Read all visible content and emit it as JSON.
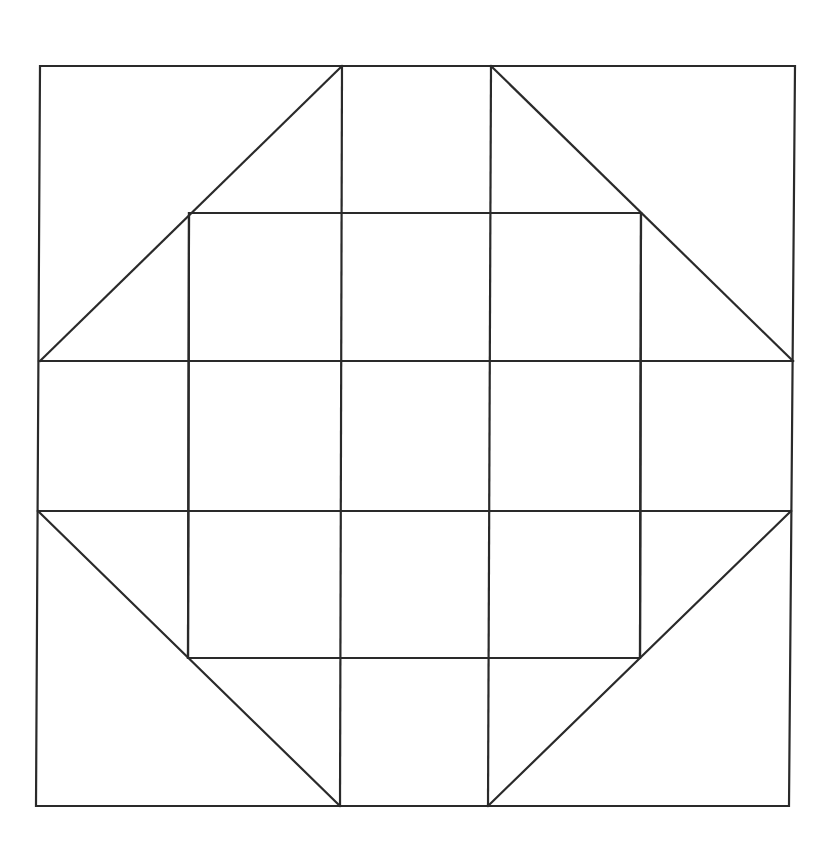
{
  "diagram": {
    "type": "quilt-block-line-drawing",
    "canvas": {
      "width": 826,
      "height": 847,
      "background": "#ffffff"
    },
    "stroke_color": "#2a2a2a",
    "outer_square": {
      "points": [
        [
          40,
          66
        ],
        [
          795,
          66
        ],
        [
          789,
          806
        ],
        [
          36,
          806
        ]
      ]
    },
    "inner_square": {
      "points": [
        [
          189,
          213
        ],
        [
          641,
          213
        ],
        [
          640,
          658
        ],
        [
          188,
          658
        ]
      ]
    },
    "vertical_lines": [
      {
        "from": [
          342,
          66
        ],
        "to": [
          340,
          806
        ]
      },
      {
        "from": [
          491,
          66
        ],
        "to": [
          488,
          806
        ]
      },
      {
        "from": [
          189,
          213
        ],
        "to": [
          188,
          658
        ]
      },
      {
        "from": [
          641,
          213
        ],
        "to": [
          640,
          658
        ]
      }
    ],
    "horizontal_lines": [
      {
        "from": [
          39,
          361
        ],
        "to": [
          793,
          361
        ]
      },
      {
        "from": [
          38,
          511
        ],
        "to": [
          791,
          511
        ]
      }
    ],
    "diagonal_lines": [
      {
        "from": [
          40,
          361
        ],
        "to": [
          342,
          66
        ]
      },
      {
        "from": [
          491,
          66
        ],
        "to": [
          793,
          361
        ]
      },
      {
        "from": [
          38,
          511
        ],
        "to": [
          340,
          806
        ]
      },
      {
        "from": [
          488,
          806
        ],
        "to": [
          791,
          511
        ]
      }
    ]
  }
}
